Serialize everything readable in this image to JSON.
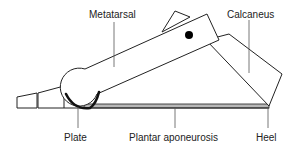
{
  "diagram": {
    "type": "windlass-mechanism",
    "labels": {
      "metatarsal": "Metatarsal",
      "calcaneus": "Calcaneus",
      "plate": "Plate",
      "plantar_aponeurosis": "Plantar aponeurosis",
      "heel": "Heel"
    },
    "colors": {
      "stroke": "#222222",
      "band_fill": "#b8b8b8",
      "plate_fill": "#111111",
      "leader": "#555555",
      "pivot": "#000000"
    }
  }
}
